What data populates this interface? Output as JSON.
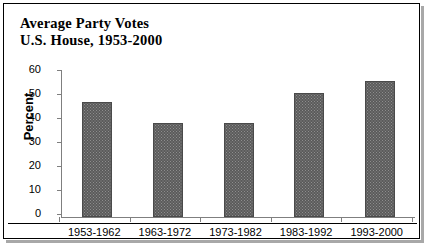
{
  "chart_data": {
    "type": "bar",
    "title": "Average Party Votes",
    "subtitle": "U.S. House, 1953-2000",
    "xlabel": "",
    "ylabel": "Percent",
    "categories": [
      "1953-1962",
      "1963-1972",
      "1973-1982",
      "1983-1992",
      "1993-2000"
    ],
    "values": [
      48,
      39,
      39,
      51.5,
      56.5
    ],
    "ylim": [
      0,
      60
    ],
    "ytick_values": [
      60,
      50,
      40,
      30,
      20,
      10,
      0
    ],
    "ytick_labels": [
      "60",
      "50",
      "40",
      "30",
      "20",
      "10",
      "0"
    ],
    "grid": false,
    "legend": false,
    "series_color": "#5b5b5b"
  },
  "title": {
    "line1": "Average Party Votes",
    "line2": "U.S. House, 1953-2000"
  },
  "axes": {
    "y_title": "Percent"
  }
}
